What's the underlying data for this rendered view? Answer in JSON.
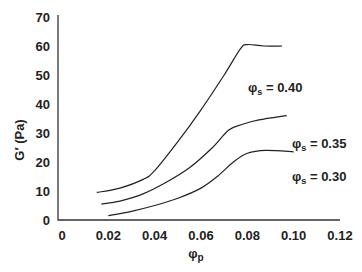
{
  "chart_data": {
    "type": "line",
    "title": "",
    "xlabel": "φp",
    "ylabel": "G′ (Pa)",
    "xlim": [
      0,
      0.12
    ],
    "ylim": [
      0,
      70
    ],
    "x_ticks": [
      "0",
      "0.02",
      "0.04",
      "0.06",
      "0.08",
      "0.10",
      "0.12"
    ],
    "y_ticks": [
      "0",
      "10",
      "20",
      "30",
      "40",
      "50",
      "60",
      "70"
    ],
    "grid": false,
    "legend": "inline labels at curve ends",
    "series": [
      {
        "name": "φs = 0.40",
        "label_main": "φ",
        "label_sub": "s",
        "label_rest": " = 0.40",
        "x": [
          0.015,
          0.025,
          0.035,
          0.04,
          0.05,
          0.06,
          0.07,
          0.077,
          0.08,
          0.087,
          0.095
        ],
        "y": [
          9.5,
          11,
          14,
          17,
          27,
          38,
          50,
          59,
          60.5,
          60,
          60
        ]
      },
      {
        "name": "φs = 0.35",
        "label_main": "φ",
        "label_sub": "s",
        "label_rest": " = 0.35",
        "x": [
          0.017,
          0.025,
          0.035,
          0.045,
          0.055,
          0.065,
          0.072,
          0.078,
          0.085,
          0.097
        ],
        "y": [
          5.5,
          6.5,
          9,
          13,
          18,
          25,
          31,
          33,
          34.5,
          36
        ]
      },
      {
        "name": "φs = 0.30",
        "label_main": "φ",
        "label_sub": "s",
        "label_rest": " = 0.30",
        "x": [
          0.02,
          0.03,
          0.04,
          0.05,
          0.06,
          0.067,
          0.074,
          0.08,
          0.088,
          0.1
        ],
        "y": [
          1.5,
          3,
          5,
          7.5,
          11,
          15,
          20,
          23,
          24,
          23.5
        ]
      }
    ]
  },
  "axes": {
    "x_label_main": "φ",
    "x_label_sub": "p",
    "y_label": "G′ (Pa)",
    "x_ticks": [
      "0",
      "0.02",
      "0.04",
      "0.06",
      "0.08",
      "0.10",
      "0.12"
    ],
    "y_ticks": [
      "0",
      "10",
      "20",
      "30",
      "40",
      "50",
      "60",
      "70"
    ]
  }
}
